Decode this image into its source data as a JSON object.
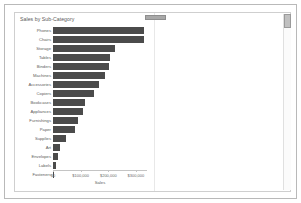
{
  "window": {
    "drag_handle_name": "panel-drag-handle",
    "scrollbar_name": "vertical-scrollbar"
  },
  "chart_data": {
    "type": "bar",
    "orientation": "horizontal",
    "title": "Sales by Sub-Category",
    "xlabel": "Sales",
    "ylabel": "",
    "xlim": [
      0,
      340000
    ],
    "grid": false,
    "legend": null,
    "bar_color": "#4b4b4b",
    "tick_labels": [
      "$0",
      "$100,000",
      "$200,000",
      "$300,000"
    ],
    "tick_values": [
      0,
      100000,
      200000,
      300000
    ],
    "categories": [
      "Phones",
      "Chairs",
      "Storage",
      "Tables",
      "Binders",
      "Machines",
      "Accessories",
      "Copiers",
      "Bookcases",
      "Appliances",
      "Furnishings",
      "Paper",
      "Supplies",
      "Art",
      "Envelopes",
      "Labels",
      "Fasteners"
    ],
    "values": [
      330007,
      328449,
      223844,
      206966,
      203413,
      189239,
      167380,
      149528,
      114880,
      107532,
      91705,
      78479,
      46674,
      27119,
      16476,
      12486,
      3024
    ]
  }
}
